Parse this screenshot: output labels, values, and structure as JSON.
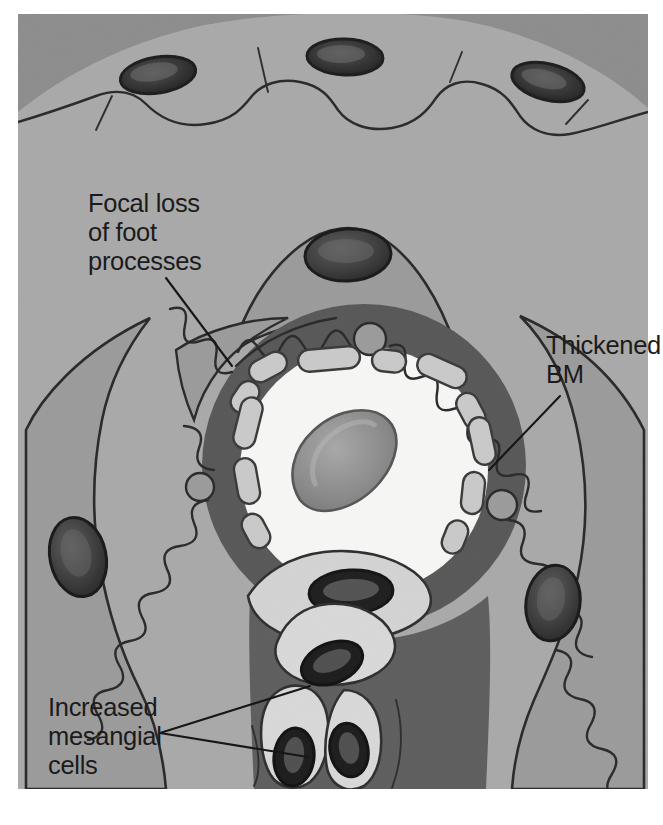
{
  "figure": {
    "width": 663,
    "height": 825,
    "background_color": "#ffffff",
    "plate_border_color": "#d9d9d9"
  },
  "palette": {
    "urinary_space_gray": "#a9a9a9",
    "capsule_band_gray": "#8d8d8d",
    "basement_membrane_gray": "#585858",
    "mesangial_matrix_gray": "#5e5e5e",
    "podocyte_body_gray": "#9b9b9b",
    "cytoplasm_light_gray": "#d3d3d3",
    "endothelium_light_gray": "#c9c9c9",
    "lumen_white": "#f6f6f4",
    "nucleus_dark": "#2b2b2b",
    "nucleus_mid": "#4a4a4a",
    "rbc_gray": "#8f8f8f",
    "outline_black": "#2a2a2a",
    "text_black": "#1b1b1b"
  },
  "annotations": [
    {
      "id": "focal-loss",
      "lines": [
        "Focal loss",
        "of foot",
        "processes"
      ],
      "text_x": 88,
      "text_y": 212,
      "line_height": 29,
      "leader": {
        "x1": 166,
        "y1": 278,
        "x2": 232,
        "y2": 366
      },
      "anchor": "start"
    },
    {
      "id": "thickened-bm",
      "lines": [
        "Thickened",
        "BM"
      ],
      "text_x": 546,
      "text_y": 354,
      "line_height": 29,
      "leader": {
        "x1": 560,
        "y1": 396,
        "x2": 489,
        "y2": 470
      },
      "anchor": "start"
    },
    {
      "id": "increased-mesangial",
      "lines": [
        "Increased",
        "mesangial",
        "cells"
      ],
      "text_x": 48,
      "text_y": 716,
      "line_height": 29,
      "leader_fan_origin": {
        "x": 160,
        "y": 733
      },
      "leaders": [
        {
          "x1": 160,
          "y1": 733,
          "x2": 310,
          "y2": 686
        },
        {
          "x1": 160,
          "y1": 733,
          "x2": 308,
          "y2": 757
        }
      ],
      "anchor": "start"
    }
  ],
  "structures": {
    "bowmans_capsule": {
      "name": "Bowman's capsule parietal epithelium",
      "nuclei_count": 3
    },
    "urinary_space": {
      "name": "Urinary space"
    },
    "capillary_lumen": {
      "name": "Capillary lumen",
      "center_x": 364,
      "center_y": 470,
      "radius": 124
    },
    "red_blood_cell": {
      "name": "Red blood cell",
      "center_x": 336,
      "center_y": 458
    },
    "basement_membrane": {
      "name": "Thickened glomerular basement membrane",
      "center_x": 364,
      "center_y": 466,
      "outer_radius": 162,
      "inner_radius": 126
    },
    "foot_processes": {
      "name": "Podocyte foot processes",
      "wavy_segments": "right, top-right, left-lower",
      "effaced_segment": "upper-left (focal loss)"
    },
    "podocytes": [
      {
        "name": "podocyte-top",
        "nucleus_x": 348,
        "nucleus_y": 255
      },
      {
        "name": "podocyte-left",
        "nucleus_x": 78,
        "nucleus_y": 557
      },
      {
        "name": "podocyte-right",
        "nucleus_x": 553,
        "nucleus_y": 603
      }
    ],
    "endothelial_cell": {
      "name": "Endothelial cell",
      "nucleus_x": 351,
      "nucleus_y": 592
    },
    "mesangial_cells": [
      {
        "name": "mesangial-cell-upper",
        "nucleus_x": 332,
        "nucleus_y": 663
      },
      {
        "name": "mesangial-cell-lower-left",
        "nucleus_x": 294,
        "nucleus_y": 757
      },
      {
        "name": "mesangial-cell-lower-right",
        "nucleus_x": 343,
        "nucleus_y": 752
      }
    ]
  }
}
